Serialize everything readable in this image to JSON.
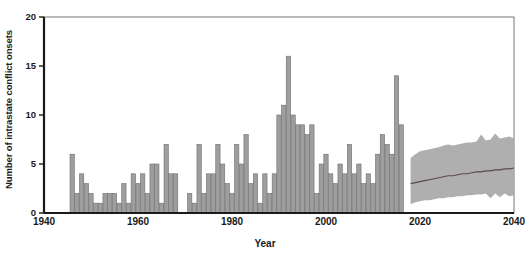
{
  "chart_data": {
    "type": "bar",
    "title": "",
    "xlabel": "Year",
    "ylabel": "Number of intrastate conflict onsets",
    "xlim": [
      1940,
      2040
    ],
    "ylim": [
      0,
      20
    ],
    "xticks": [
      1940,
      1960,
      1980,
      2000,
      2020,
      2040
    ],
    "yticks": [
      0,
      5,
      10,
      15,
      20
    ],
    "grid": false,
    "legend": false,
    "bar_color": "#9e9e9e",
    "bar_edge_color": "#6e6e6e",
    "band_color": "#a8a8a8",
    "median_line_color": "#5a4a4a",
    "axis_color": "#1a1a1a",
    "historical": {
      "name": "Observed conflict onsets",
      "x": [
        1946,
        1947,
        1948,
        1949,
        1950,
        1951,
        1952,
        1953,
        1954,
        1955,
        1956,
        1957,
        1958,
        1959,
        1960,
        1961,
        1962,
        1963,
        1964,
        1965,
        1966,
        1967,
        1968,
        1969,
        1970,
        1971,
        1972,
        1973,
        1974,
        1975,
        1976,
        1977,
        1978,
        1979,
        1980,
        1981,
        1982,
        1983,
        1984,
        1985,
        1986,
        1987,
        1988,
        1989,
        1990,
        1991,
        1992,
        1993,
        1994,
        1995,
        1996,
        1997,
        1998,
        1999,
        2000,
        2001,
        2002,
        2003,
        2004,
        2005,
        2006,
        2007,
        2008,
        2009,
        2010,
        2011,
        2012,
        2013,
        2014,
        2015,
        2016,
        2017
      ],
      "values": [
        6,
        2,
        4,
        3,
        2,
        1,
        1,
        2,
        2,
        2,
        1,
        3,
        1,
        4,
        3,
        4,
        2,
        5,
        5,
        1,
        7,
        4,
        4,
        0,
        0,
        2,
        1,
        7,
        2,
        4,
        4,
        7,
        5,
        3,
        2,
        7,
        5,
        8,
        3,
        4,
        1,
        4,
        2,
        4,
        10,
        11,
        16,
        10,
        9,
        9,
        8,
        9,
        2,
        5,
        6,
        4,
        3,
        5,
        4,
        7,
        4,
        5,
        3,
        4,
        3,
        6,
        8,
        7,
        6,
        14,
        9,
        0
      ]
    },
    "forecast": {
      "name": "Projected conflict onsets",
      "x": [
        2018,
        2019,
        2020,
        2021,
        2022,
        2023,
        2024,
        2025,
        2026,
        2027,
        2028,
        2029,
        2030,
        2031,
        2032,
        2033,
        2034,
        2035,
        2036,
        2037,
        2038,
        2039,
        2040
      ],
      "median": [
        3.0,
        3.1,
        3.2,
        3.3,
        3.4,
        3.5,
        3.6,
        3.7,
        3.8,
        3.8,
        3.9,
        4.0,
        4.0,
        4.1,
        4.2,
        4.2,
        4.3,
        4.3,
        4.4,
        4.4,
        4.5,
        4.5,
        4.6
      ],
      "upper": [
        5.6,
        6.0,
        6.3,
        6.4,
        6.5,
        6.6,
        6.7,
        6.9,
        7.0,
        6.9,
        7.0,
        7.1,
        7.2,
        7.2,
        7.3,
        8.0,
        7.4,
        7.5,
        8.1,
        7.6,
        7.7,
        7.8,
        7.6
      ],
      "lower": [
        0.9,
        1.1,
        1.2,
        1.3,
        1.3,
        1.4,
        1.5,
        1.5,
        1.6,
        1.6,
        1.7,
        1.7,
        1.8,
        1.8,
        1.9,
        1.9,
        2.0,
        1.5,
        2.0,
        1.6,
        2.0,
        1.7,
        1.8
      ]
    }
  },
  "axes": {
    "y_tick_labels": [
      "0",
      "5",
      "10",
      "15",
      "20"
    ],
    "x_tick_labels": [
      "1940",
      "1960",
      "1980",
      "2000",
      "2020",
      "2040"
    ],
    "x_axis_title": "Year",
    "y_axis_title": "Number of intrastate conflict onsets"
  },
  "footer": {
    "fragment": ""
  }
}
